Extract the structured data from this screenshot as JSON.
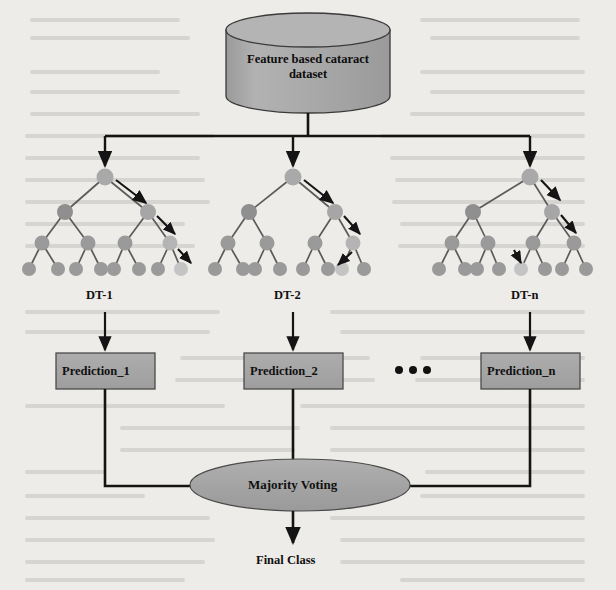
{
  "diagram": {
    "title_text": "",
    "database": {
      "label_line1": "Feature based cataract",
      "label_line2": "dataset",
      "shape": "cylinder",
      "fill": "#a6a6a6",
      "stroke": "#3a3a3a"
    },
    "trees": [
      {
        "id": "dt-1",
        "label": "DT-1",
        "cx": 105
      },
      {
        "id": "dt-2",
        "label": "DT-2",
        "cx": 293
      },
      {
        "id": "dt-n",
        "label": "DT-n",
        "cx": 530
      }
    ],
    "predictions": [
      {
        "id": "prediction-1",
        "label": "Prediction_1",
        "cx": 105
      },
      {
        "id": "prediction-2",
        "label": "Prediction_2",
        "cx": 293
      },
      {
        "id": "prediction-n",
        "label": "Prediction_n",
        "cx": 530
      }
    ],
    "ellipsis": "•••",
    "voting": {
      "label": "Majority Voting",
      "shape": "ellipse",
      "fill": "#a6a6a6",
      "stroke": "#4a4a4a"
    },
    "output": {
      "label": "Final Class"
    },
    "colors": {
      "node_normal": "#9b9b9b",
      "node_highlight": "#c2c2c2",
      "box_fill": "#a6a6a6",
      "box_stroke": "#4a4a4a",
      "edge": "#4a4a4a",
      "connector": "#1a1a1a",
      "background": "#eeece8",
      "text": "#111111"
    }
  }
}
